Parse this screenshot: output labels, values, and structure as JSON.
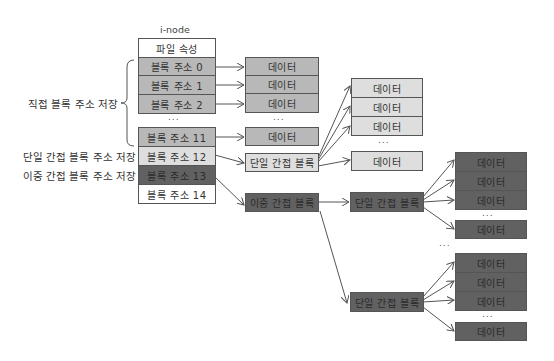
{
  "inode": {
    "title": "i-node",
    "attr_row": "파일 속성",
    "rows": [
      "블록 주소 0",
      "블록 주소 1",
      "블록 주소 2",
      "블록 주소 11",
      "블록 주소 12",
      "블록 주소 13",
      "블록 주소 14"
    ],
    "dots": "..."
  },
  "labels": {
    "direct": "직접 블록 주소 저장",
    "single": "단일 간접 블록 주소 저장",
    "double": "이중 간접 블록 주소 저장"
  },
  "blocks": {
    "data": "데이터",
    "single_indirect": "단일 간접 블록",
    "double_indirect": "이중 간접 블록",
    "dots": "..."
  },
  "colors": {
    "direct": "#b8b8b8",
    "single": "#dedede",
    "double": "#616161",
    "triple": "#ffffff"
  }
}
